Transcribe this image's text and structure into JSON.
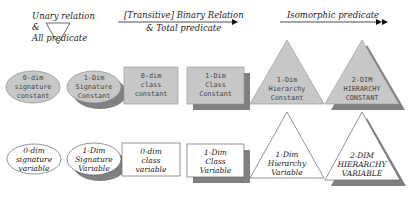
{
  "headers": {
    "unary": {
      "line1": "Unary relation",
      "line2": "&",
      "line3": "All predicate"
    },
    "binary": {
      "line1": "[Transitive] Binary Relation",
      "line2": "& Total predicate"
    },
    "isomorphic": {
      "line1": "Isomorphic predicate"
    }
  },
  "colors": {
    "const_fill": "#c8c8c8",
    "shadow": "#808080",
    "var_fill": "#ffffff",
    "stroke": "#777777"
  },
  "constants": [
    {
      "shape": "ellipse",
      "lines": [
        "0-dim",
        "signature",
        "constant"
      ]
    },
    {
      "shape": "ellipse-shadow",
      "lines": [
        "1-Dim",
        "Signature",
        "Constant"
      ]
    },
    {
      "shape": "rect",
      "lines": [
        "0-dim",
        "class",
        "constant"
      ]
    },
    {
      "shape": "rect-shadow",
      "lines": [
        "1-Dim",
        "Class",
        "Constant"
      ]
    },
    {
      "shape": "triangle",
      "lines": [
        "1-Dim",
        "Hierarchy",
        "Constant"
      ]
    },
    {
      "shape": "triangle-shadow",
      "lines": [
        "2-DIM",
        "HIERARCHY",
        "CONSTANT"
      ]
    }
  ],
  "variables": [
    {
      "shape": "ellipse",
      "lines": [
        "0-dim",
        "signature",
        "variable"
      ]
    },
    {
      "shape": "ellipse-shadow",
      "lines": [
        "1-Dim",
        "Signature",
        "Variable"
      ]
    },
    {
      "shape": "rect",
      "lines": [
        "0-dim",
        "class",
        "variable"
      ]
    },
    {
      "shape": "rect-shadow",
      "lines": [
        "1-Dim",
        "Class",
        "Variable"
      ]
    },
    {
      "shape": "triangle",
      "lines": [
        "1-Dim",
        "Hierarchy",
        "Variable"
      ]
    },
    {
      "shape": "triangle-shadow",
      "lines": [
        "2-DIM",
        "HIERARCHY",
        "VARIABLE"
      ]
    }
  ]
}
